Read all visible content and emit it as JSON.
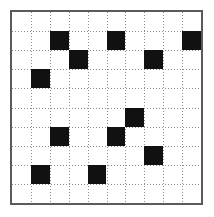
{
  "chart_data": {
    "type": "heatmap",
    "title": "",
    "subtitle": "",
    "xlabel": "",
    "ylabel": "",
    "grid": true,
    "legend": "none",
    "rows": 10,
    "cols": 10,
    "xlim": [
      0,
      10
    ],
    "ylim": [
      0,
      10
    ],
    "x_ticklabels": [],
    "y_ticklabels": [],
    "value_names": {
      "0": "empty",
      "1": "filled"
    },
    "colors": {
      "filled": "#111111",
      "empty": "#ffffff",
      "gridline": "#8c8c8c",
      "border": "#5a5a5a",
      "background": "#ffffff"
    },
    "filled_count": 13,
    "empty_count": 87,
    "filled_cells": [
      {
        "row": 1,
        "col": 2
      },
      {
        "row": 1,
        "col": 5
      },
      {
        "row": 1,
        "col": 9
      },
      {
        "row": 2,
        "col": 3
      },
      {
        "row": 2,
        "col": 7
      },
      {
        "row": 3,
        "col": 1
      },
      {
        "row": 5,
        "col": 6
      },
      {
        "row": 6,
        "col": 2
      },
      {
        "row": 6,
        "col": 5
      },
      {
        "row": 7,
        "col": 7
      },
      {
        "row": 8,
        "col": 1
      },
      {
        "row": 8,
        "col": 4
      }
    ],
    "matrix": [
      [
        0,
        0,
        0,
        0,
        0,
        0,
        0,
        0,
        0,
        0
      ],
      [
        0,
        0,
        1,
        0,
        0,
        1,
        0,
        0,
        0,
        1
      ],
      [
        0,
        0,
        0,
        1,
        0,
        0,
        0,
        1,
        0,
        0
      ],
      [
        0,
        1,
        0,
        0,
        0,
        0,
        0,
        0,
        0,
        0
      ],
      [
        0,
        0,
        0,
        0,
        0,
        0,
        0,
        0,
        0,
        0
      ],
      [
        0,
        0,
        0,
        0,
        0,
        0,
        1,
        0,
        0,
        0
      ],
      [
        0,
        0,
        1,
        0,
        0,
        1,
        0,
        0,
        0,
        0
      ],
      [
        0,
        0,
        0,
        0,
        0,
        0,
        0,
        1,
        0,
        0
      ],
      [
        0,
        1,
        0,
        0,
        1,
        0,
        0,
        0,
        0,
        0
      ],
      [
        0,
        0,
        0,
        0,
        0,
        0,
        0,
        0,
        0,
        0
      ]
    ]
  },
  "figure": {
    "name": "binary-grid-pattern",
    "border_width_px": 2
  }
}
